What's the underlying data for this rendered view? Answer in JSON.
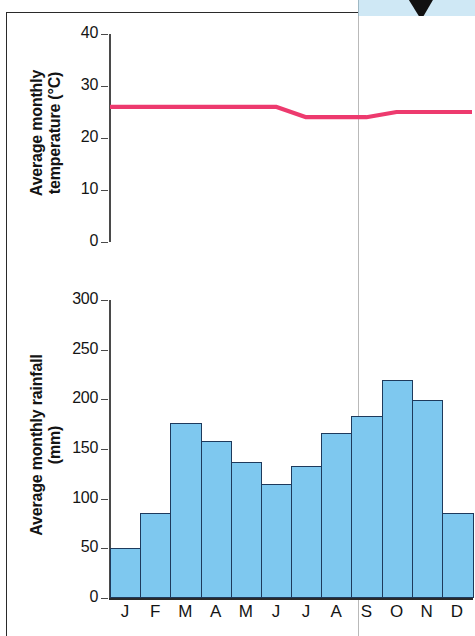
{
  "decoration": {
    "top_strip_color": "#cfe8f5",
    "arrow_color": "#111111"
  },
  "chart_data": [
    {
      "type": "line",
      "title": "",
      "ylabel": "Average monthly temperature (°C)",
      "xlabel": "",
      "categories": [
        "J",
        "F",
        "M",
        "A",
        "M",
        "J",
        "J",
        "A",
        "S",
        "O",
        "N",
        "D"
      ],
      "values": [
        26,
        26,
        26,
        26,
        26,
        26,
        24,
        24,
        24,
        25,
        25,
        25
      ],
      "ylim": [
        0,
        40
      ],
      "yticks": [
        0,
        10,
        20,
        30,
        40
      ],
      "ytick_labels": [
        "0",
        "10",
        "20",
        "30",
        "40"
      ],
      "line_color": "#ed3a6e",
      "grid": false,
      "legend": "none"
    },
    {
      "type": "bar",
      "title": "",
      "ylabel": "Average monthly rainfall (mm)",
      "xlabel": "",
      "categories": [
        "J",
        "F",
        "M",
        "A",
        "M",
        "J",
        "J",
        "A",
        "S",
        "O",
        "N",
        "D"
      ],
      "values": [
        50,
        86,
        176,
        158,
        137,
        115,
        133,
        166,
        183,
        219,
        199,
        86
      ],
      "ylim": [
        0,
        300
      ],
      "yticks": [
        0,
        50,
        100,
        150,
        200,
        250,
        300
      ],
      "ytick_labels": [
        "0",
        "50",
        "100",
        "150",
        "200",
        "250",
        "300"
      ],
      "bar_color": "#7ec8ef",
      "bar_edge_color": "#1e3a5c",
      "grid": false,
      "legend": "none"
    }
  ],
  "temperature": {
    "axis_title_line1": "Average monthly",
    "axis_title_line2": "temperature (°C)"
  },
  "rainfall": {
    "axis_title_line1": "Average monthly rainfall",
    "axis_title_line2": "(mm)"
  }
}
